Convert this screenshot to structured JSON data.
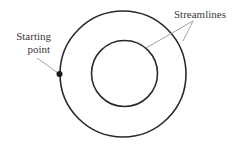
{
  "diagram": {
    "type": "streamlines-concentric-circles",
    "labels": {
      "starting_point_line1": "Starting",
      "starting_point_line2": "point",
      "streamlines": "Streamlines"
    },
    "shapes": {
      "outer_circle": {
        "cx": 123,
        "cy": 74,
        "r": 63
      },
      "inner_circle": {
        "cx": 124.5,
        "cy": 73.5,
        "r": 33
      },
      "starting_dot": {
        "cx": 59.5,
        "cy": 74,
        "r": 3
      }
    },
    "colors": {
      "stroke": "#2a2a2a",
      "leader": "#8a8a8a",
      "text": "#3a3a3a",
      "background": "#ffffff"
    }
  }
}
